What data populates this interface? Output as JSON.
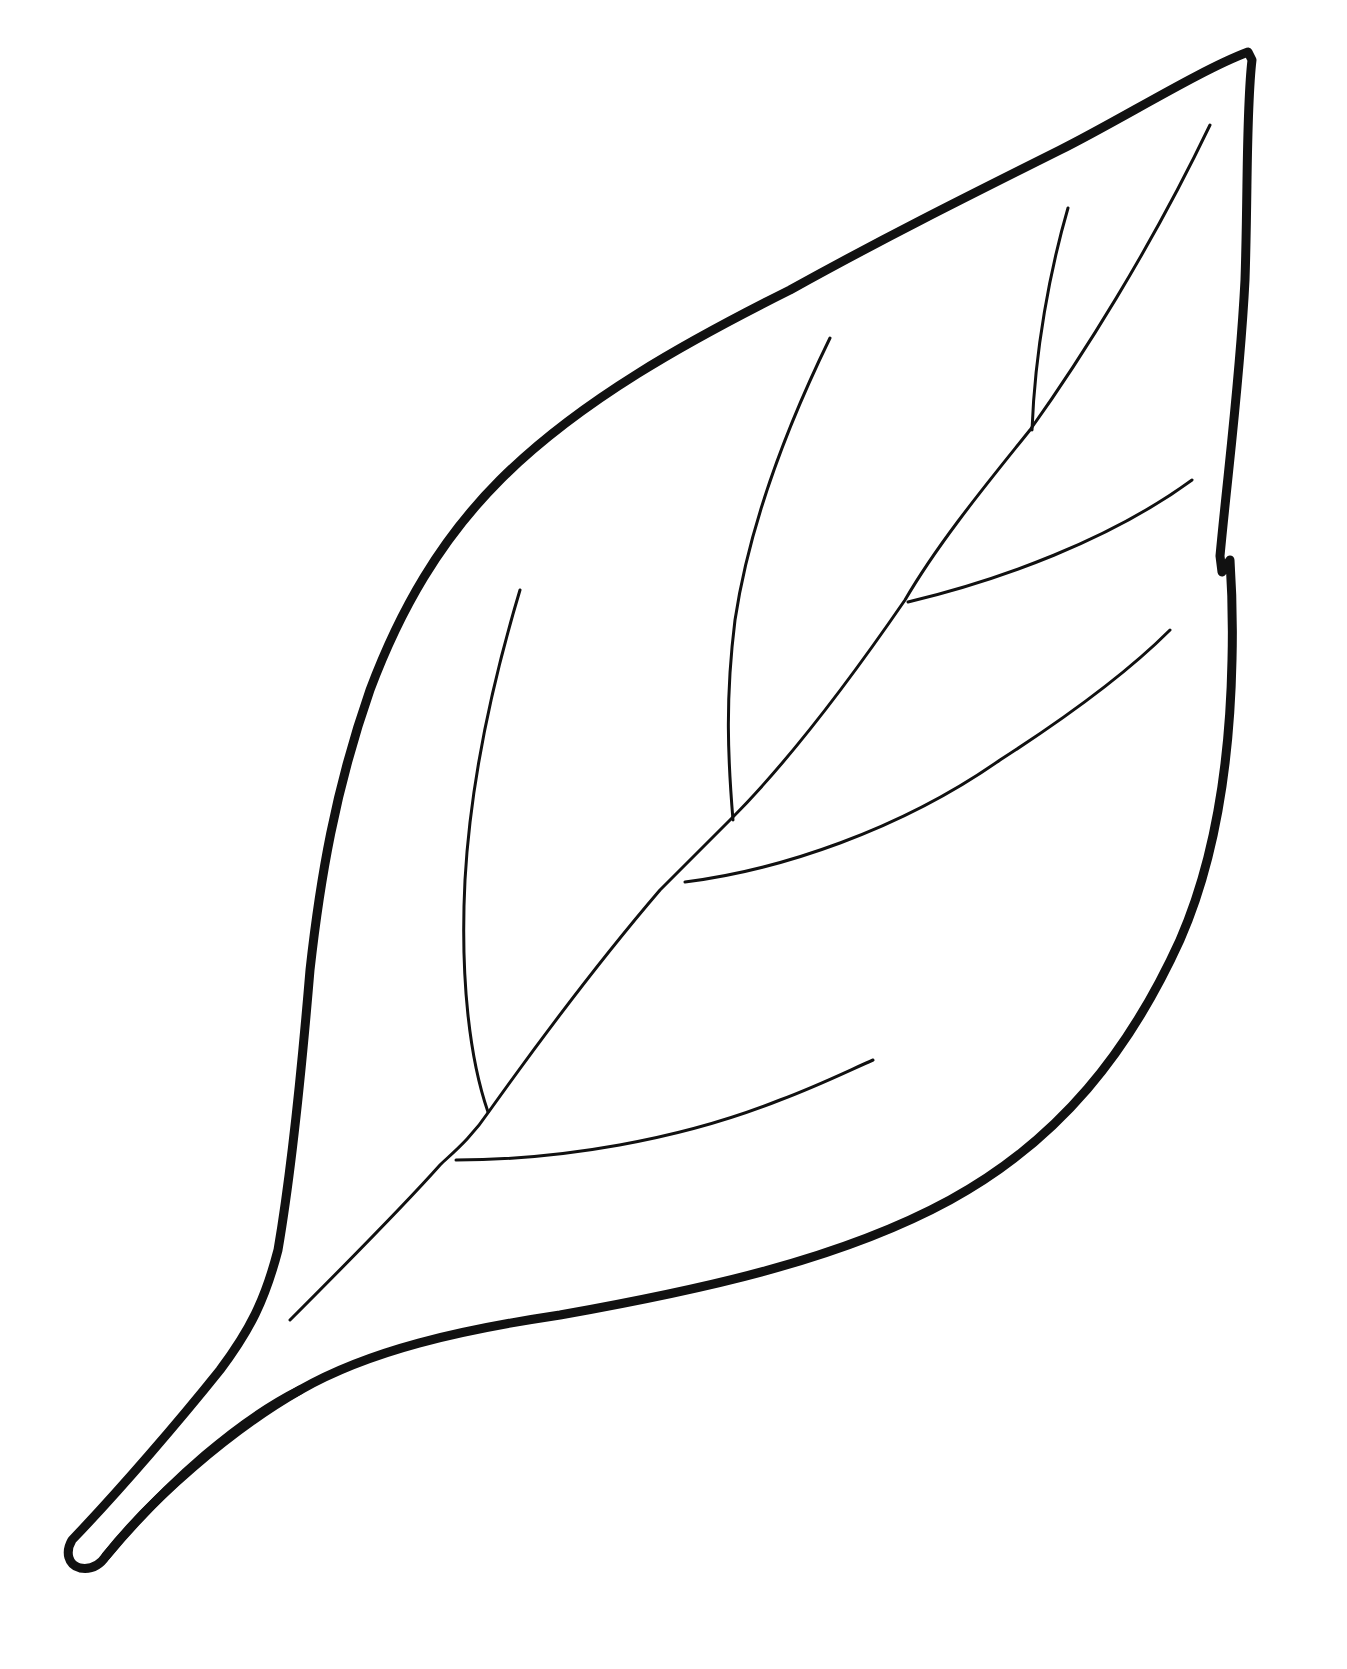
{
  "image": {
    "subject": "Leaf outline coloring page",
    "background_color": "#ffffff",
    "stroke_color": "#111111"
  },
  "labels": {
    "outline": "leaf-outline",
    "midrib": "leaf-midrib",
    "stem": "leaf-stem"
  }
}
